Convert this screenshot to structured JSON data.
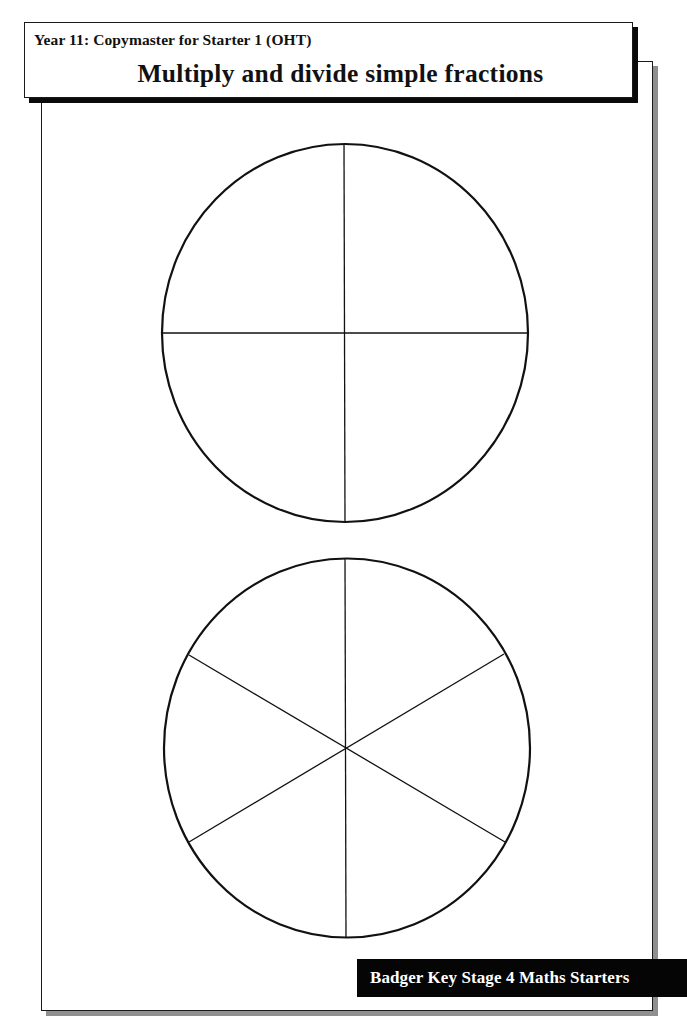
{
  "header": {
    "subtitle": "Year 11: Copymaster for Starter 1 (OHT)",
    "title": "Multiply and divide simple fractions"
  },
  "diagrams": [
    {
      "name": "circle-quarters",
      "shape": "circle",
      "divisions": 4,
      "description": "Circle divided into 4 equal parts"
    },
    {
      "name": "circle-sixths",
      "shape": "circle",
      "divisions": 6,
      "description": "Circle divided into 6 equal parts"
    }
  ],
  "footer": {
    "publisher_label": "Badger Key Stage 4 Maths Starters"
  },
  "colors": {
    "ink": "#111111",
    "badge_background": "#050505",
    "badge_text": "#ffffff",
    "frame_shadow": "#8f8f8f"
  }
}
